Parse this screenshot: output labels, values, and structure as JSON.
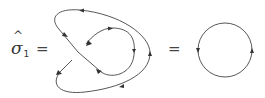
{
  "equation": {
    "operator_symbol": "σ",
    "operator_hat": "^",
    "operator_subscript": "1",
    "equals_1": "=",
    "equals_2": "="
  },
  "diagram": {
    "line_color": "#444444",
    "left_figure": "knotted-loop-with-crossing",
    "right_figure": "circle-loop",
    "arrow_count_left": 8,
    "arrow_count_right": 2
  }
}
